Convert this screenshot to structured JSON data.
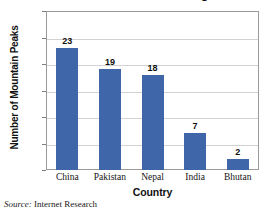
{
  "chart_data": {
    "type": "bar",
    "title": "Over 7000 Meters in Height",
    "subtitle": "",
    "xlabel": "Country",
    "ylabel": "Number of Mountain Peaks",
    "categories": [
      "China",
      "Pakistan",
      "Nepal",
      "India",
      "Bhutan"
    ],
    "values": [
      23,
      19,
      18,
      7,
      2
    ],
    "value_labels": [
      "23",
      "19",
      "18",
      "7",
      "2"
    ],
    "ylim": [
      0,
      30
    ],
    "ytick_values": [
      0,
      5,
      10,
      15,
      20,
      25,
      30
    ],
    "ytick_labels": [
      "0",
      "5",
      "10",
      "15",
      "20",
      "25",
      "30"
    ],
    "grid": true,
    "grid_axis": "y",
    "legend": false,
    "legend_position": "none",
    "bar_color": "#3e66a8",
    "gridline_color": "#d2d2d2",
    "axis_color": "#9a9a9a",
    "plot_background": "#ffffff"
  },
  "footer": {
    "source_word": "Source:",
    "source_text": "Internet Research"
  }
}
